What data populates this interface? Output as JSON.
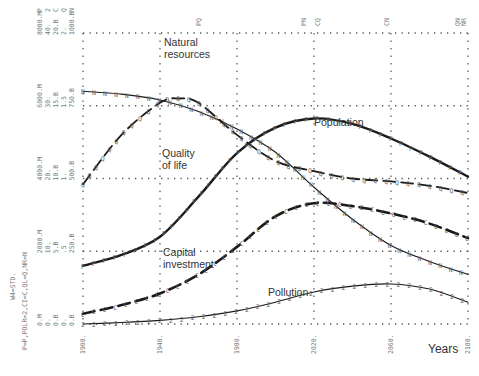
{
  "chart_data": {
    "type": "line",
    "title": "",
    "xlabel": "Years",
    "ylabel": "",
    "xlim": [
      1900,
      2100
    ],
    "x_ticks": [
      "1900.",
      "1940.",
      "1980.",
      "2020.",
      "2060.",
      "2100."
    ],
    "y_axis_columns": [
      {
        "variable": "P",
        "ticks": [
          "0.M",
          "2000.M",
          "4000.M",
          "6000.M",
          "8000.M"
        ]
      },
      {
        "variable": "POLR",
        "ticks": [
          "0.",
          "10.",
          "20.",
          "30.",
          "40."
        ]
      },
      {
        "variable": "CI",
        "ticks": [
          "0.B",
          "5.B",
          "10.B",
          "15.B",
          "20.B"
        ]
      },
      {
        "variable": "QL",
        "ticks": [
          "0.",
          ".5",
          "1.",
          "1.5",
          "2."
        ]
      },
      {
        "variable": "NR",
        "ticks": [
          "0.B",
          "250.B",
          "500.B",
          "750.B",
          "1000.B"
        ]
      }
    ],
    "top_axis_header": [
      "P",
      "2",
      "C",
      "Q",
      "N"
    ],
    "top_markers": [
      {
        "label": "PQ",
        "x": 1960
      },
      {
        "label": "PN",
        "x": 2015
      },
      {
        "label": "CQ",
        "x": 2022
      },
      {
        "label": "CN",
        "x": 2058
      },
      {
        "label": "QN",
        "x": 2095
      },
      {
        "label": "NR",
        "x": 2098
      }
    ],
    "legend_text": [
      "W4=STD.",
      "P=P,POLR=2,CI=C,QL=Q,NR=N"
    ],
    "grid": true,
    "series": [
      {
        "name": "Natural resources",
        "symbol": "N",
        "style": "thin",
        "x": [
          1900,
          1920,
          1940,
          1960,
          1980,
          2000,
          2020,
          2040,
          2060,
          2080,
          2100
        ],
        "values": [
          800,
          790,
          770,
          730,
          670,
          590,
          470,
          360,
          270,
          215,
          170
        ]
      },
      {
        "name": "Population",
        "symbol": "P",
        "style": "thick",
        "x": [
          1900,
          1920,
          1940,
          1960,
          1980,
          2000,
          2020,
          2040,
          2060,
          2080,
          2100
        ],
        "values": [
          1600,
          1900,
          2400,
          3500,
          4700,
          5400,
          5650,
          5500,
          5100,
          4600,
          4050
        ]
      },
      {
        "name": "Quality of life",
        "symbol": "Q",
        "style": "dashed",
        "x": [
          1900,
          1920,
          1940,
          1950,
          1960,
          1980,
          2000,
          2020,
          2040,
          2060,
          2080,
          2100
        ],
        "values": [
          0.96,
          1.3,
          1.52,
          1.55,
          1.52,
          1.3,
          1.12,
          1.05,
          1.0,
          0.98,
          0.95,
          0.9
        ]
      },
      {
        "name": "Capital investment",
        "symbol": "C",
        "style": "dashed-thick",
        "x": [
          1900,
          1920,
          1940,
          1960,
          1980,
          2000,
          2020,
          2040,
          2060,
          2080,
          2100
        ],
        "values": [
          0.7,
          1.3,
          2.1,
          3.4,
          5.3,
          7.4,
          8.3,
          8.1,
          7.6,
          6.9,
          5.9
        ]
      },
      {
        "name": "Pollution",
        "symbol": "2",
        "style": "thin",
        "x": [
          1900,
          1920,
          1940,
          1960,
          1980,
          2000,
          2020,
          2040,
          2060,
          2080,
          2100
        ],
        "values": [
          0.0,
          0.2,
          0.5,
          1.0,
          1.8,
          3.0,
          4.4,
          5.2,
          5.5,
          4.8,
          3.0
        ]
      }
    ],
    "annotations": [
      {
        "text": "Natural resources",
        "x": 1933,
        "y_px": 36
      },
      {
        "text": "Population",
        "x": 2021,
        "y_px": 122
      },
      {
        "text": "Quality of life",
        "x": 1935,
        "y_px": 145
      },
      {
        "text": "Capital investment",
        "x": 1935,
        "y_px": 252
      },
      {
        "text": "Pollution",
        "x": 2005,
        "y_px": 292
      }
    ]
  },
  "labels": {
    "natural_resources": [
      "Natural",
      "resources"
    ],
    "population": "Population",
    "quality_of_life": [
      "Quality",
      "of life"
    ],
    "capital_investment": [
      "Capital",
      "investment"
    ],
    "pollution": "Pollution",
    "years": "Years"
  }
}
